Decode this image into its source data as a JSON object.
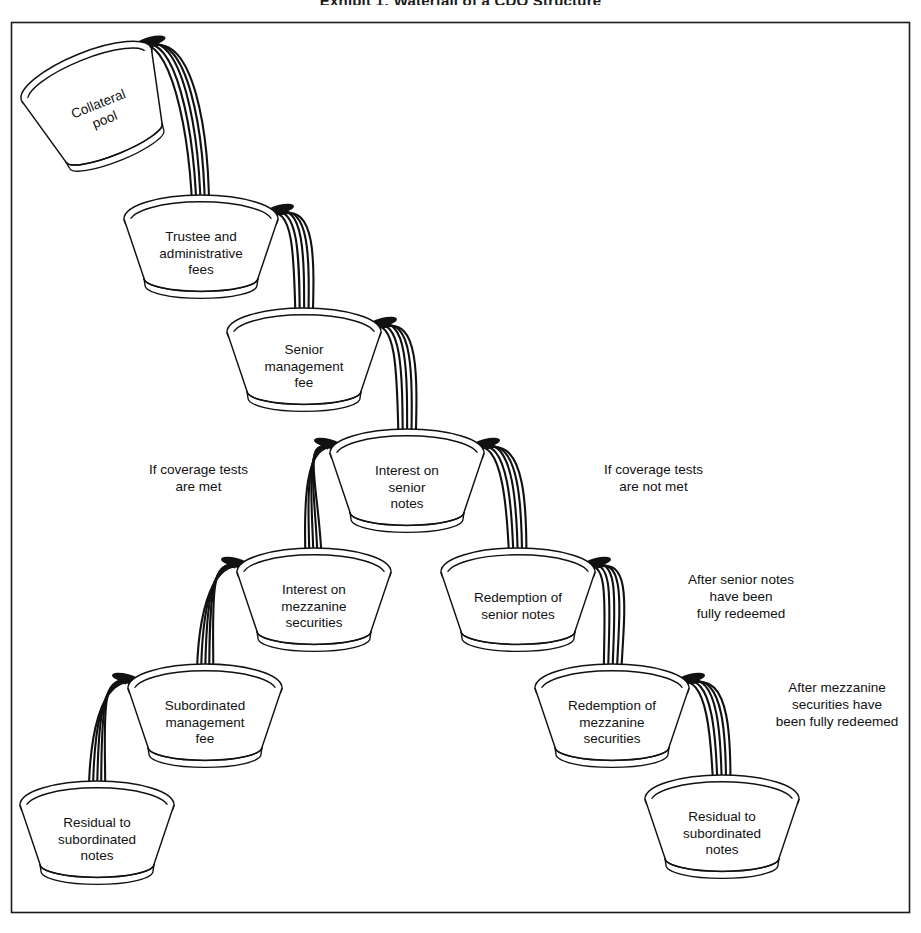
{
  "title": "Exhibit 1: Waterfall of a CDO Structure",
  "diagram": {
    "type": "cash-flow-waterfall",
    "border_color": "#1a1a1a",
    "ink_color": "#111111",
    "stream_count_per_flow": 5,
    "buckets": [
      {
        "id": "collateral-pool",
        "label": "Collateral\npool",
        "row": 0,
        "tilted": true,
        "x": 30,
        "y": 48,
        "w": 140,
        "h": 120
      },
      {
        "id": "trustee-admin-fees",
        "label": "Trustee and\nadministrative\nfees",
        "row": 1,
        "tilted": false,
        "x": 124,
        "y": 193,
        "w": 154,
        "h": 110
      },
      {
        "id": "senior-management-fee",
        "label": "Senior\nmanagement\nfee",
        "row": 2,
        "tilted": false,
        "x": 227,
        "y": 306,
        "w": 154,
        "h": 110
      },
      {
        "id": "interest-on-senior-notes",
        "label": "Interest on\nsenior\nnotes",
        "row": 3,
        "tilted": false,
        "x": 330,
        "y": 427,
        "w": 154,
        "h": 110
      },
      {
        "id": "interest-on-mezzanine",
        "label": "Interest on\nmezzanine\nsecurities",
        "row": 4,
        "tilted": false,
        "x": 237,
        "y": 546,
        "w": 154,
        "h": 110
      },
      {
        "id": "redemption-senior-notes",
        "label": "Redemption of\nsenior notes",
        "row": 4,
        "tilted": false,
        "x": 441,
        "y": 546,
        "w": 154,
        "h": 110
      },
      {
        "id": "subordinated-management-fee",
        "label": "Subordinated\nmanagement\nfee",
        "row": 5,
        "tilted": false,
        "x": 128,
        "y": 662,
        "w": 154,
        "h": 110
      },
      {
        "id": "redemption-mezzanine",
        "label": "Redemption of\nmezzanine\nsecurities",
        "row": 5,
        "tilted": false,
        "x": 535,
        "y": 662,
        "w": 154,
        "h": 110
      },
      {
        "id": "residual-subordinated-left",
        "label": "Residual to\nsubordinated\nnotes",
        "row": 6,
        "tilted": false,
        "x": 20,
        "y": 779,
        "w": 154,
        "h": 110
      },
      {
        "id": "residual-subordinated-right",
        "label": "Residual to\nsubordinated\nnotes",
        "row": 6,
        "tilted": false,
        "x": 645,
        "y": 773,
        "w": 154,
        "h": 110
      }
    ],
    "flows": [
      {
        "id": "flow-pool-to-trustee",
        "from": "collateral-pool",
        "to": "trustee-admin-fees"
      },
      {
        "id": "flow-trustee-to-senior-fee",
        "from": "trustee-admin-fees",
        "to": "senior-management-fee"
      },
      {
        "id": "flow-senior-fee-to-interest",
        "from": "senior-management-fee",
        "to": "interest-on-senior-notes"
      },
      {
        "id": "flow-interest-to-mezzanine",
        "from": "interest-on-senior-notes",
        "to": "interest-on-mezzanine"
      },
      {
        "id": "flow-interest-to-redemption",
        "from": "interest-on-senior-notes",
        "to": "redemption-senior-notes"
      },
      {
        "id": "flow-mezz-to-subfee",
        "from": "interest-on-mezzanine",
        "to": "subordinated-management-fee"
      },
      {
        "id": "flow-redsenior-to-redmezz",
        "from": "redemption-senior-notes",
        "to": "redemption-mezzanine"
      },
      {
        "id": "flow-subfee-to-residual",
        "from": "subordinated-management-fee",
        "to": "residual-subordinated-left"
      },
      {
        "id": "flow-redmezz-to-residual",
        "from": "redemption-mezzanine",
        "to": "residual-subordinated-right"
      }
    ],
    "annotations": [
      {
        "id": "annot-coverage-met",
        "text": "If coverage tests\nare met",
        "x": 116,
        "y": 461,
        "w": 165
      },
      {
        "id": "annot-coverage-not-met",
        "text": "If coverage tests\nare not met",
        "x": 566,
        "y": 461,
        "w": 175
      },
      {
        "id": "annot-senior-redeemed",
        "text": "After senior notes\nhave been\nfully redeemed",
        "x": 656,
        "y": 571,
        "w": 170
      },
      {
        "id": "annot-mezzanine-redeemed",
        "text": "After mezzanine\nsecurities have\nbeen fully redeemed",
        "x": 757,
        "y": 679,
        "w": 160
      }
    ]
  }
}
